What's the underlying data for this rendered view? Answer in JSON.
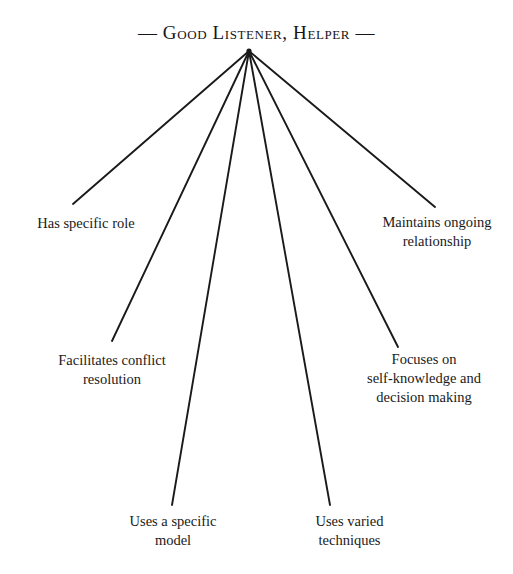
{
  "diagram": {
    "title": "— Good Listener, Helper —",
    "title_text": "Good Listener, Helper",
    "type": "radial-fan",
    "background_color": "#ffffff",
    "line_color": "#1a1a1a",
    "text_color": "#1a1a1a",
    "apex": {
      "x": 249,
      "y": 51
    },
    "branches": [
      {
        "label": "Has specific role",
        "line_end": {
          "x": 73,
          "y": 204
        },
        "label_position": {
          "x": 20,
          "y": 214
        }
      },
      {
        "label": "Facilitates conflict\nresolution",
        "line_end": {
          "x": 112,
          "y": 341
        },
        "label_position": {
          "x": 52,
          "y": 351
        }
      },
      {
        "label": "Uses a specific\nmodel",
        "line_end": {
          "x": 172,
          "y": 505
        },
        "label_position": {
          "x": 113,
          "y": 513
        }
      },
      {
        "label": "Uses varied\ntechniques",
        "line_end": {
          "x": 330,
          "y": 505
        },
        "label_position": {
          "x": 292,
          "y": 513
        }
      },
      {
        "label": "Focuses on\nself-knowledge and\ndecision making",
        "line_end": {
          "x": 398,
          "y": 347
        },
        "label_position": {
          "x": 356,
          "y": 351
        }
      },
      {
        "label": "Maintains ongoing\nrelationship",
        "line_end": {
          "x": 435,
          "y": 207
        },
        "label_position": {
          "x": 372,
          "y": 214
        }
      }
    ]
  }
}
